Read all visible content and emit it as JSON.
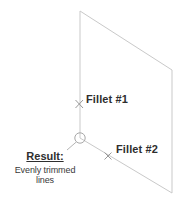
{
  "diagram": {
    "type": "cad-fillet-illustration",
    "canvas": {
      "width": 182,
      "height": 201
    },
    "line_color": "#c9c9c9",
    "marker_color": "#9a9a9a",
    "text_color": "#2e2e2e",
    "geometry": {
      "shape": "parallelogram-outline",
      "vertices": {
        "top_left": [
          80,
          11
        ],
        "right": [
          172,
          70
        ],
        "bottom_right": [
          172,
          193
        ],
        "corner_point": [
          80,
          138
        ]
      },
      "vertical_edge": {
        "x": 80,
        "y1": 11,
        "y2": 138
      },
      "bottom_edge": {
        "x1": 80,
        "y1": 138,
        "x2": 172,
        "y2": 193
      }
    },
    "markers": [
      {
        "name": "fillet-1-x-marker",
        "kind": "x",
        "x": 79,
        "y": 104,
        "size": 4
      },
      {
        "name": "fillet-2-x-marker",
        "kind": "x",
        "x": 108,
        "y": 156,
        "size": 4
      },
      {
        "name": "result-circle-marker",
        "kind": "circle",
        "x": 80,
        "y": 138,
        "r": 5
      }
    ],
    "leader": {
      "from": [
        76,
        142
      ],
      "to": [
        66,
        150
      ]
    }
  },
  "labels": {
    "fillet_1": "Fillet #1",
    "fillet_2": "Fillet #2",
    "result_title": "Result:",
    "result_subtitle": "Evenly trimmed lines"
  }
}
